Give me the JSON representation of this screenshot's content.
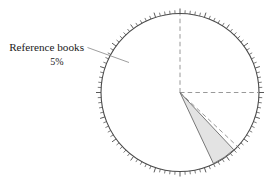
{
  "chart_data": {
    "type": "pie",
    "title": "",
    "subtitle": "",
    "xlabel": "",
    "ylabel": "",
    "legend_position": "none",
    "grid": false,
    "units": "percent",
    "scale": {
      "type": "percentage-ring",
      "min": 0,
      "max": 100,
      "major_tick_every": 5,
      "minor_tick_every": 1,
      "tick_count": 100,
      "tick_direction": "outward",
      "tick_labels": []
    },
    "start_angle_deg": 0,
    "direction": "clockwise",
    "categories": [
      "Reference books"
    ],
    "values": [
      5
    ],
    "annotations": [
      {
        "label": "Reference books",
        "value_label": "5%",
        "value": 5,
        "start_percent": 38,
        "end_percent": 43,
        "start_angle_deg": 136.8,
        "end_angle_deg": 154.8,
        "fill": "#e3e3e3",
        "leader_line": true
      }
    ],
    "reference_radials": [
      {
        "name": "radial-0-percent",
        "percent": 0,
        "angle_deg": 0,
        "style": "dashed"
      },
      {
        "name": "radial-25-percent",
        "percent": 25,
        "angle_deg": 90,
        "style": "dashed"
      },
      {
        "name": "radial-37-percent",
        "percent": 37,
        "angle_deg": 133.2,
        "style": "dashed"
      }
    ],
    "colors": {
      "outline": "#4a4a4a",
      "tick": "#5a5a5a",
      "wedge_fill": "#e3e3e3",
      "wedge_edge": "#6a6a6a",
      "dashed": "#8d8d8d",
      "leader": "#8d8d8d",
      "text": "#1a1a1a",
      "background": "#ffffff"
    },
    "geometry": {
      "center_x": 180,
      "center_y": 92.5,
      "radius": 79
    }
  },
  "figure": {
    "label": {
      "title": "Reference books",
      "percent": "5%"
    }
  }
}
